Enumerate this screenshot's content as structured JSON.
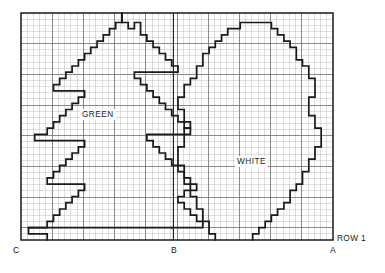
{
  "chart_data": {
    "type": "table",
    "grid": {
      "columns": 50,
      "rows": 37,
      "cell_px": 6.24,
      "major_gridline_every": 5,
      "grid_on": true,
      "minor_color": "#b9b9b9",
      "major_color": "#6e6e6e",
      "border_color": "#1a1a1a",
      "plot_left": 21,
      "plot_top": 13,
      "plot_right": 333,
      "plot_bottom": 240
    },
    "regions": [
      {
        "name": "GREEN",
        "label": "GREEN",
        "label_col": 10.5,
        "label_row": 21.5,
        "fill": "none"
      },
      {
        "name": "WHITE",
        "label": "WHITE",
        "label_col": 35.5,
        "label_row": 14.0,
        "fill": "none"
      }
    ],
    "axis_markers": [
      {
        "name": "C",
        "label": "C",
        "position": "bottom-left",
        "col": 0
      },
      {
        "name": "B",
        "label": "B",
        "position": "bottom-center",
        "col": 24.4
      },
      {
        "name": "A",
        "label": "A",
        "position": "bottom-right",
        "col": 50
      }
    ],
    "row_label": "ROW 1",
    "vertical_divider_col": 24.4,
    "outlines": {
      "tree_left": "M 47.2 240 L 47.2 233.8 L 28.5 233.8 L 28.5 227.6 L 47.2 227.6 L 47.2 221.4 L 53.5 221.4 L 53.5 215.2 L 59.7 215.2 L 59.7 209.0 L 65.9 209.0 L 65.9 202.7 L 72.1 202.7 L 72.1 196.5 L 78.4 196.5 L 78.4 190.3 L 84.6 190.3 L 84.6 184.1 L 47.2 184.1 L 47.2 177.9 L 53.5 177.9 L 53.5 171.7 L 59.7 171.7 L 59.7 165.4 L 65.9 165.4 L 65.9 159.2 L 72.1 159.2 L 72.1 153.0 L 78.4 153.0 L 78.4 146.8 L 84.6 146.8 L 84.6 140.6 L 34.7 140.6 L 34.7 134.4 L 47.2 134.4 L 47.2 128.1 L 53.5 128.1 L 53.5 121.9 L 59.7 121.9 L 59.7 115.7 L 65.9 115.7 L 65.9 109.5 L 72.1 109.5 L 72.1 103.3 L 78.4 103.3 L 78.4 97.1 L 84.6 97.1 L 84.6 90.8 L 53.5 90.8 L 53.5 84.6 L 59.7 84.6 L 59.7 78.4 L 65.9 78.4 L 65.9 72.2 L 72.1 72.2 L 72.1 66.0 L 78.4 66.0 L 78.4 59.8 L 84.6 59.8 L 84.6 53.5 L 90.8 53.5 L 90.8 47.3 L 97.1 47.3 L 97.1 41.1 L 103.3 41.1 L 103.3 34.9 L 109.5 34.9 L 109.5 28.7 L 115.7 28.7 L 115.7 22.5 L 122.0 22.5 L 122.0 13.0",
      "tree_right": "M 122.0 13.0 L 122.0 22.5 L 128.2 22.5 L 128.2 28.7 L 134.4 28.7 L 134.4 22.5 L 140.6 22.5 L 140.6 34.9 L 146.9 34.9 L 146.9 41.1 L 153.1 41.1 L 153.1 47.3 L 159.3 47.3 L 159.3 53.5 L 165.5 53.5 L 165.5 59.8 L 171.8 59.8 L 171.8 66.0 L 178.0 66.0 L 178.0 72.2 L 134.4 72.2 L 134.4 78.4 L 140.6 78.4 L 140.6 84.6 L 146.9 84.6 L 146.9 90.8 L 153.1 90.8 L 153.1 97.1 L 159.3 97.1 L 159.3 103.3 L 165.5 103.3 L 165.5 109.5 L 171.8 109.5 L 171.8 115.7 L 178.0 115.7 L 178.0 121.9 L 184.2 121.9 L 184.2 128.1 L 190.4 128.1 L 190.4 134.4 L 146.9 134.4 L 146.9 140.6 L 153.1 140.6 L 153.1 146.8 L 159.3 146.8 L 159.3 153.0 L 165.5 153.0 L 165.5 159.2 L 171.8 159.2 L 171.8 165.4 L 178.0 165.4 L 178.0 171.7 L 184.2 171.7 L 184.2 177.9 L 190.4 177.9 L 190.4 184.1 L 196.7 184.1 L 196.7 190.3 L 184.2 190.3 L 184.2 196.5 L 178.0 196.5 L 178.0 202.7 L 184.2 202.7 L 184.2 209.0 L 190.4 209.0 L 190.4 215.2 L 196.7 215.2 L 196.7 221.4 L 202.9 221.4 L 202.9 227.6 L 171.8 227.6",
      "tree_base": "M 28.5 227.6 L 171.8 227.6",
      "ball": "M 215.3 240 L 215.3 233.8 L 209.1 233.8 L 209.1 221.4 L 202.9 221.4 L 202.9 209.0 L 196.7 209.0 L 196.7 196.5 L 190.4 196.5 L 190.4 184.1 L 184.2 184.1 L 184.2 165.4 L 178.0 165.4 L 178.0 146.8 L 184.2 146.8 L 184.2 128.1 L 190.4 128.1 L 190.4 121.9 L 184.2 121.9 L 184.2 109.5 L 178.0 109.5 L 178.0 97.1 L 184.2 97.1 L 184.2 84.6 L 190.4 84.6 L 190.4 78.4 L 196.7 78.4 L 196.7 66.0 L 202.9 66.0 L 202.9 53.5 L 209.1 53.5 L 209.1 47.3 L 215.3 47.3 L 215.3 41.1 L 221.6 41.1 L 221.6 34.9 L 227.8 34.9 L 227.8 28.7 L 240.2 28.7 L 240.2 22.5 L 271.4 22.5 L 271.4 28.7 L 277.6 28.7 L 277.6 34.9 L 283.9 34.9 L 283.9 41.1 L 290.1 41.1 L 290.1 47.3 L 296.3 47.3 L 296.3 59.8 L 302.5 59.8 L 302.5 66.0 L 308.8 66.0 L 308.8 78.4 L 315.0 78.4 L 315.0 97.1 L 308.8 97.1 L 308.8 115.7 L 315.0 115.7 L 315.0 128.1 L 321.2 128.1 L 321.2 146.8 L 315.0 146.8 L 315.0 159.2 L 308.8 159.2 L 308.8 171.7 L 302.5 171.7 L 302.5 184.1 L 296.3 184.1 L 296.3 190.3 L 290.1 190.3 L 290.1 202.7 L 283.9 202.7 L 283.9 209.0 L 277.6 209.0 L 277.6 215.2 L 271.4 215.2 L 271.4 221.4 L 265.2 221.4 L 265.2 227.6 L 258.9 227.6 L 258.9 233.8 L 252.7 233.8 L 252.7 240"
    }
  }
}
